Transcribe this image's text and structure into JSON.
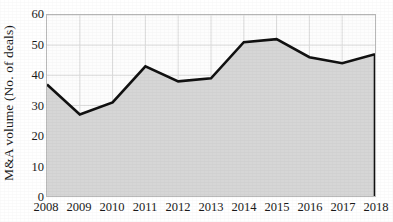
{
  "chart_data": {
    "type": "area",
    "title": "",
    "xlabel": "",
    "ylabel": "M&A volume (No. of deals)",
    "categories": [
      "2008",
      "2009",
      "2010",
      "2011",
      "2012",
      "2013",
      "2014",
      "2015",
      "2016",
      "2017",
      "2018"
    ],
    "values": [
      37,
      27,
      31,
      43,
      38,
      39,
      51,
      52,
      46,
      44,
      47
    ],
    "series": [
      {
        "name": "M&A volume (No. of deals)",
        "values": [
          37,
          27,
          31,
          43,
          38,
          39,
          51,
          52,
          46,
          44,
          47
        ]
      }
    ],
    "ylim": [
      0,
      60
    ],
    "yticks": [
      0,
      10,
      20,
      30,
      40,
      50,
      60
    ],
    "ytick_labels": [
      "0",
      "10",
      "20",
      "30",
      "40",
      "50",
      "60"
    ],
    "xtick_labels": [
      "2008",
      "2009",
      "2010",
      "2011",
      "2012",
      "2013",
      "2014",
      "2015",
      "2016",
      "2017",
      "2018"
    ],
    "grid": true,
    "legend": "none",
    "line_color": "#111111",
    "fill_color": "#d6d6d6",
    "grid_color": "#dcdcdc",
    "axis_color": "#b9b9b9",
    "plot_background": "#fdfdfd"
  }
}
